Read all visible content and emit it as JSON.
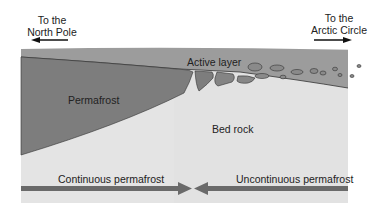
{
  "direction_labels": {
    "left": {
      "line1": "To the",
      "line2": "North Pole"
    },
    "right": {
      "line1": "To the",
      "line2": "Arctic Circle"
    }
  },
  "region_labels": {
    "active_layer": "Active layer",
    "permafrost": "Permafrost",
    "bed_rock": "Bed rock"
  },
  "zone_labels": {
    "continuous": "Continuous permafrost",
    "uncontinuous": "Uncontinuous permafrost"
  },
  "colors": {
    "active_layer": "#9a9a9a",
    "permafrost": "#7c7c7c",
    "bed_rock": "#e2e2e2",
    "zone_arrow": "#6a6a6a",
    "outline": "#333333"
  }
}
